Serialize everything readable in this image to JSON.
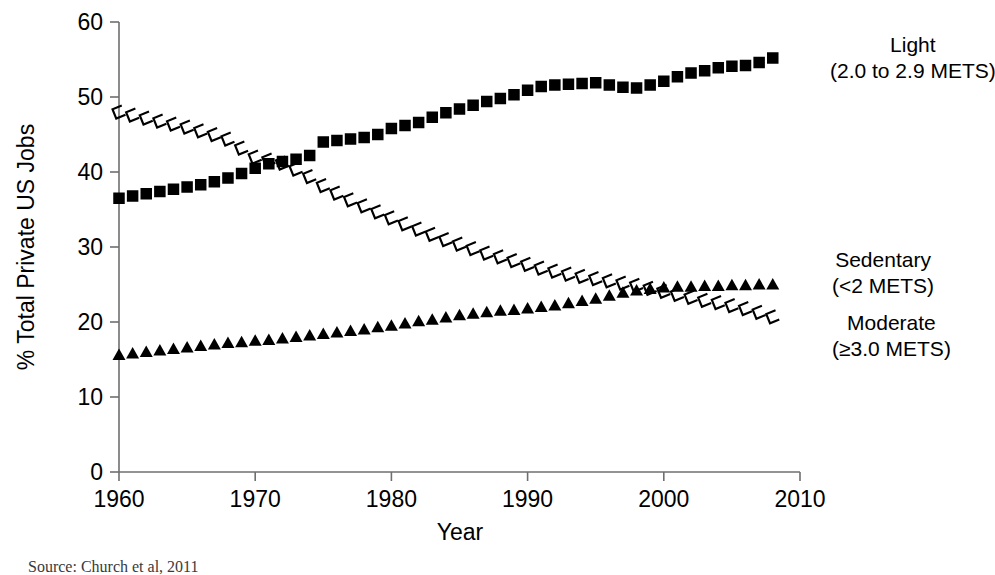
{
  "chart_data": {
    "type": "line",
    "title": "",
    "xlabel": "Year",
    "ylabel": "% Total Private US Jobs",
    "xlim": [
      1960,
      2010
    ],
    "ylim": [
      0,
      60
    ],
    "xticks": [
      1960,
      1970,
      1980,
      1990,
      2000,
      2010
    ],
    "ytick_labels": [
      "0",
      "10",
      "20",
      "30",
      "40",
      "50",
      "60"
    ],
    "yticks": [
      0,
      10,
      20,
      30,
      40,
      50,
      60
    ],
    "grid": false,
    "legend_position": "right-inline-labels",
    "x": [
      1960,
      1961,
      1962,
      1963,
      1964,
      1965,
      1966,
      1967,
      1968,
      1969,
      1970,
      1971,
      1972,
      1973,
      1974,
      1975,
      1976,
      1977,
      1978,
      1979,
      1980,
      1981,
      1982,
      1983,
      1984,
      1985,
      1986,
      1987,
      1988,
      1989,
      1990,
      1991,
      1992,
      1993,
      1994,
      1995,
      1996,
      1997,
      1998,
      1999,
      2000,
      2001,
      2002,
      2003,
      2004,
      2005,
      2006,
      2007,
      2008
    ],
    "series": [
      {
        "name": "Light",
        "legend_label": "Light",
        "legend_sublabel": "(2.0 to 2.9 METS)",
        "marker": "filled-square",
        "color": "#000000",
        "values": [
          36.5,
          36.8,
          37.1,
          37.4,
          37.7,
          38.0,
          38.3,
          38.7,
          39.2,
          39.8,
          40.5,
          41.1,
          41.4,
          41.7,
          42.2,
          44.0,
          44.2,
          44.4,
          44.6,
          45.0,
          45.8,
          46.2,
          46.6,
          47.3,
          47.9,
          48.4,
          48.9,
          49.4,
          49.8,
          50.3,
          50.9,
          51.4,
          51.6,
          51.7,
          51.8,
          51.9,
          51.6,
          51.3,
          51.2,
          51.6,
          52.1,
          52.7,
          53.2,
          53.5,
          53.9,
          54.1,
          54.2,
          54.6,
          55.2
        ]
      },
      {
        "name": "Sedentary",
        "legend_label": "Sedentary",
        "legend_sublabel": "(<2 METS)",
        "marker": "open-c",
        "color": "#000000",
        "values": [
          48.0,
          47.6,
          47.2,
          46.8,
          46.4,
          46.0,
          45.5,
          45.0,
          44.4,
          43.2,
          42.0,
          41.6,
          41.2,
          40.4,
          39.4,
          38.2,
          37.2,
          36.3,
          35.5,
          34.7,
          33.9,
          33.1,
          32.4,
          31.7,
          31.0,
          30.4,
          29.8,
          29.2,
          28.7,
          28.2,
          27.7,
          27.2,
          26.8,
          26.4,
          26.1,
          25.8,
          25.5,
          25.2,
          24.9,
          24.5,
          24.1,
          23.7,
          23.3,
          22.9,
          22.6,
          22.2,
          21.8,
          21.3,
          20.7
        ]
      },
      {
        "name": "Moderate",
        "legend_label": "Moderate",
        "legend_sublabel": "(≥3.0 METS)",
        "marker": "filled-triangle",
        "color": "#000000",
        "values": [
          15.5,
          15.7,
          15.9,
          16.1,
          16.3,
          16.5,
          16.7,
          16.9,
          17.1,
          17.2,
          17.4,
          17.5,
          17.7,
          17.9,
          18.1,
          18.3,
          18.5,
          18.7,
          18.9,
          19.2,
          19.4,
          19.7,
          20.0,
          20.2,
          20.5,
          20.8,
          21.0,
          21.2,
          21.4,
          21.5,
          21.7,
          21.9,
          22.1,
          22.4,
          22.7,
          23.0,
          23.4,
          23.8,
          24.1,
          24.3,
          24.5,
          24.6,
          24.6,
          24.7,
          24.7,
          24.8,
          24.8,
          24.9,
          24.9
        ]
      }
    ]
  },
  "labels": {
    "legend_light_line1": "Light",
    "legend_light_line2": "(2.0 to 2.9 METS)",
    "legend_sedentary_line1": "Sedentary",
    "legend_sedentary_line2": "(<2 METS)",
    "legend_moderate_line1": "Moderate",
    "legend_moderate_line2": "(≥3.0 METS)",
    "x_axis_title": "Year",
    "y_axis_title": "% Total Private US Jobs",
    "source_note": "Source: Church et al, 2011"
  }
}
